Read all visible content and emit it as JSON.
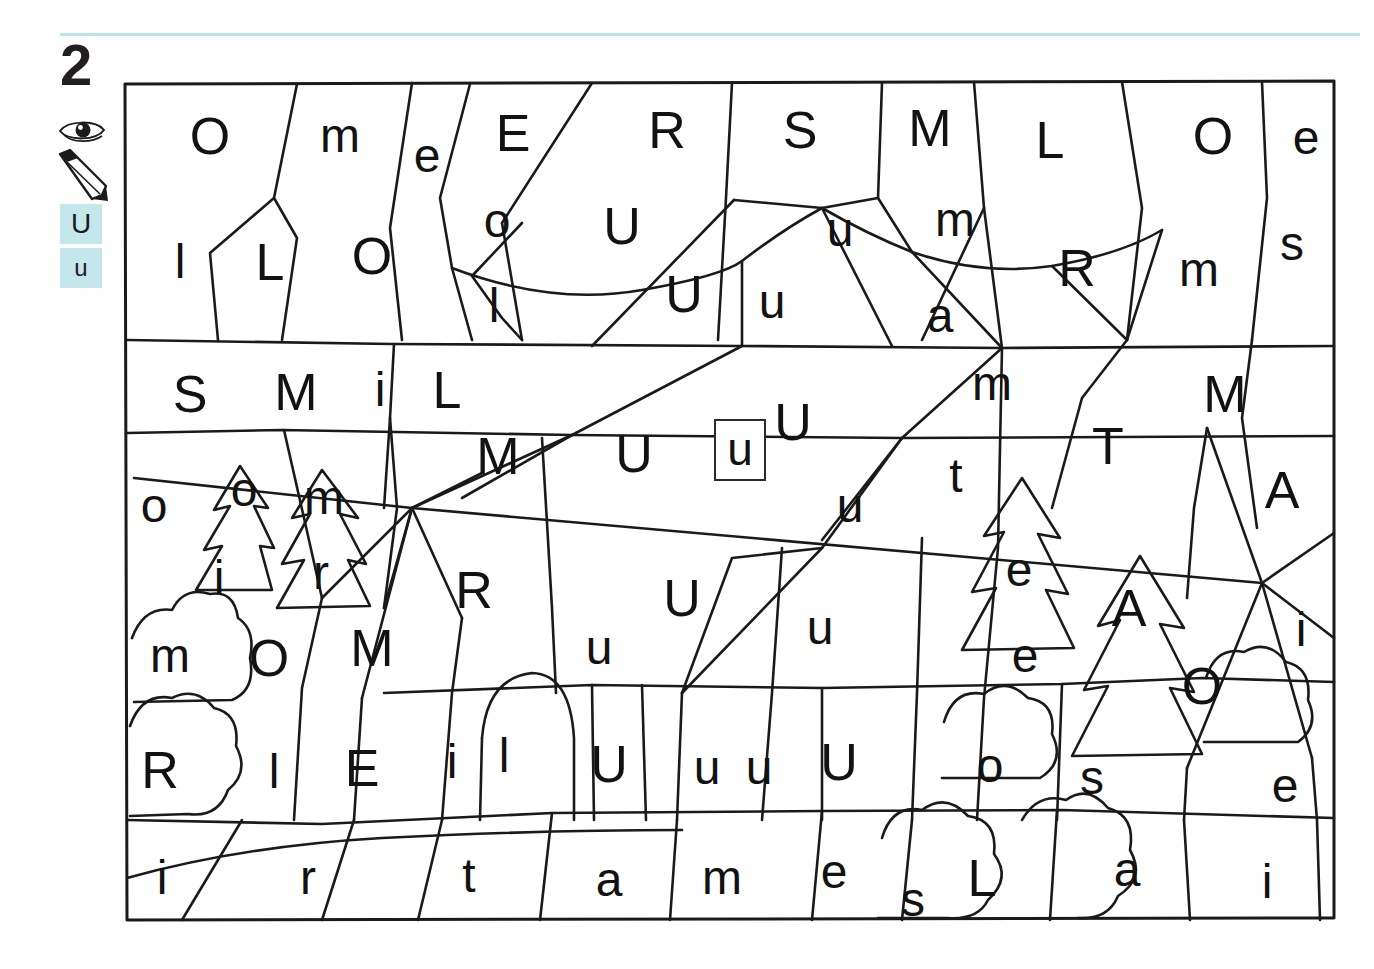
{
  "exercise": {
    "number": "2",
    "icons": [
      {
        "name": "eye-icon",
        "label": "look"
      },
      {
        "name": "pencil-icon",
        "label": "write"
      }
    ],
    "target_letters": {
      "uppercase": "U",
      "lowercase": "u",
      "highlight_color": "#c4e7ec"
    }
  },
  "puzzle": {
    "sample_cell": {
      "letter": "u",
      "highlighted": true
    },
    "ink_color": "#1a1a1a",
    "cells": [
      {
        "letter": "O",
        "x": 88,
        "y": 58,
        "size": "big"
      },
      {
        "letter": "m",
        "x": 218,
        "y": 58,
        "size": "small"
      },
      {
        "letter": "e",
        "x": 305,
        "y": 78,
        "size": "small"
      },
      {
        "letter": "E",
        "x": 391,
        "y": 55,
        "size": "big"
      },
      {
        "letter": "R",
        "x": 545,
        "y": 52,
        "size": "big"
      },
      {
        "letter": "S",
        "x": 678,
        "y": 52,
        "size": "big"
      },
      {
        "letter": "M",
        "x": 808,
        "y": 50,
        "size": "big"
      },
      {
        "letter": "L",
        "x": 928,
        "y": 62,
        "size": "big"
      },
      {
        "letter": "O",
        "x": 1091,
        "y": 58,
        "size": "big"
      },
      {
        "letter": "e",
        "x": 1184,
        "y": 60,
        "size": "small"
      },
      {
        "letter": "l",
        "x": 58,
        "y": 184,
        "size": "small"
      },
      {
        "letter": "L",
        "x": 148,
        "y": 184,
        "size": "big"
      },
      {
        "letter": "O",
        "x": 250,
        "y": 178,
        "size": "big"
      },
      {
        "letter": "o",
        "x": 375,
        "y": 143,
        "size": "small"
      },
      {
        "letter": "l",
        "x": 372,
        "y": 228,
        "size": "small"
      },
      {
        "letter": "U",
        "x": 500,
        "y": 148,
        "size": "big"
      },
      {
        "letter": "U",
        "x": 562,
        "y": 216,
        "size": "big"
      },
      {
        "letter": "u",
        "x": 650,
        "y": 224,
        "size": "small"
      },
      {
        "letter": "u",
        "x": 718,
        "y": 152,
        "size": "small"
      },
      {
        "letter": "m",
        "x": 833,
        "y": 142,
        "size": "small"
      },
      {
        "letter": "a",
        "x": 818,
        "y": 238,
        "size": "small"
      },
      {
        "letter": "R",
        "x": 955,
        "y": 190,
        "size": "big"
      },
      {
        "letter": "m",
        "x": 1077,
        "y": 192,
        "size": "small"
      },
      {
        "letter": "s",
        "x": 1170,
        "y": 166,
        "size": "small"
      },
      {
        "letter": "S",
        "x": 68,
        "y": 316,
        "size": "big"
      },
      {
        "letter": "M",
        "x": 174,
        "y": 314,
        "size": "big"
      },
      {
        "letter": "i",
        "x": 258,
        "y": 312,
        "size": "small"
      },
      {
        "letter": "L",
        "x": 325,
        "y": 312,
        "size": "big"
      },
      {
        "letter": "M",
        "x": 376,
        "y": 378,
        "size": "big"
      },
      {
        "letter": "U",
        "x": 512,
        "y": 376,
        "size": "big"
      },
      {
        "letter": "U",
        "x": 671,
        "y": 344,
        "size": "big"
      },
      {
        "letter": "u",
        "x": 728,
        "y": 428,
        "size": "small"
      },
      {
        "letter": "m",
        "x": 870,
        "y": 306,
        "size": "small"
      },
      {
        "letter": "t",
        "x": 834,
        "y": 398,
        "size": "small"
      },
      {
        "letter": "T",
        "x": 986,
        "y": 368,
        "size": "big"
      },
      {
        "letter": "M",
        "x": 1103,
        "y": 316,
        "size": "big"
      },
      {
        "letter": "A",
        "x": 1160,
        "y": 412,
        "size": "big"
      },
      {
        "letter": "o",
        "x": 32,
        "y": 428,
        "size": "small"
      },
      {
        "letter": "o",
        "x": 122,
        "y": 412,
        "size": "small"
      },
      {
        "letter": "m",
        "x": 202,
        "y": 420,
        "size": "small"
      },
      {
        "letter": "i",
        "x": 97,
        "y": 500,
        "size": "small"
      },
      {
        "letter": "r",
        "x": 199,
        "y": 495,
        "size": "small"
      },
      {
        "letter": "R",
        "x": 352,
        "y": 512,
        "size": "big"
      },
      {
        "letter": "U",
        "x": 560,
        "y": 520,
        "size": "big"
      },
      {
        "letter": "u",
        "x": 477,
        "y": 570,
        "size": "small"
      },
      {
        "letter": "u",
        "x": 698,
        "y": 550,
        "size": "small"
      },
      {
        "letter": "e",
        "x": 897,
        "y": 492,
        "size": "small"
      },
      {
        "letter": "A",
        "x": 1007,
        "y": 530,
        "size": "big"
      },
      {
        "letter": "e",
        "x": 903,
        "y": 578,
        "size": "small"
      },
      {
        "letter": "i",
        "x": 1179,
        "y": 552,
        "size": "small"
      },
      {
        "letter": "m",
        "x": 48,
        "y": 578,
        "size": "small"
      },
      {
        "letter": "O",
        "x": 147,
        "y": 580,
        "size": "big"
      },
      {
        "letter": "M",
        "x": 250,
        "y": 570,
        "size": "big"
      },
      {
        "letter": "O",
        "x": 1080,
        "y": 608,
        "size": "big"
      },
      {
        "letter": "R",
        "x": 38,
        "y": 692,
        "size": "big"
      },
      {
        "letter": "l",
        "x": 152,
        "y": 694,
        "size": "small"
      },
      {
        "letter": "E",
        "x": 240,
        "y": 690,
        "size": "big"
      },
      {
        "letter": "i",
        "x": 330,
        "y": 684,
        "size": "small"
      },
      {
        "letter": "l",
        "x": 382,
        "y": 678,
        "size": "small"
      },
      {
        "letter": "U",
        "x": 487,
        "y": 686,
        "size": "big"
      },
      {
        "letter": "u",
        "x": 585,
        "y": 690,
        "size": "small"
      },
      {
        "letter": "u",
        "x": 637,
        "y": 690,
        "size": "small"
      },
      {
        "letter": "U",
        "x": 717,
        "y": 684,
        "size": "big"
      },
      {
        "letter": "o",
        "x": 868,
        "y": 688,
        "size": "small"
      },
      {
        "letter": "s",
        "x": 970,
        "y": 700,
        "size": "small"
      },
      {
        "letter": "e",
        "x": 1163,
        "y": 708,
        "size": "small"
      },
      {
        "letter": "i",
        "x": 40,
        "y": 800,
        "size": "small"
      },
      {
        "letter": "r",
        "x": 186,
        "y": 800,
        "size": "small"
      },
      {
        "letter": "t",
        "x": 347,
        "y": 798,
        "size": "small"
      },
      {
        "letter": "a",
        "x": 487,
        "y": 802,
        "size": "small"
      },
      {
        "letter": "m",
        "x": 600,
        "y": 800,
        "size": "small"
      },
      {
        "letter": "e",
        "x": 712,
        "y": 794,
        "size": "small"
      },
      {
        "letter": "s",
        "x": 791,
        "y": 822,
        "size": "small"
      },
      {
        "letter": "L",
        "x": 860,
        "y": 800,
        "size": "big"
      },
      {
        "letter": "a",
        "x": 1005,
        "y": 792,
        "size": "small"
      },
      {
        "letter": "i",
        "x": 1145,
        "y": 804,
        "size": "small"
      }
    ]
  }
}
